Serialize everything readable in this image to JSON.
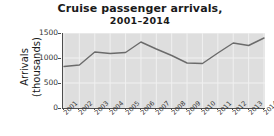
{
  "chart_data": {
    "type": "line",
    "title": "Cruise passenger arrivals,",
    "subtitle": "2001–2014",
    "xlabel": "",
    "ylabel": "Arrivals\n(thousands)",
    "ylabel_line1": "Arrivals",
    "ylabel_line2": "(thousands)",
    "categories": [
      "2001",
      "2002",
      "2003",
      "2004",
      "2005",
      "2006",
      "2007",
      "2008",
      "2009",
      "2010",
      "2011",
      "2012",
      "2013",
      "2014"
    ],
    "values": [
      830,
      860,
      1120,
      1090,
      1110,
      1320,
      1180,
      1050,
      900,
      890,
      1100,
      1300,
      1250,
      1400
    ],
    "series": [
      {
        "name": "Cruise passenger arrivals",
        "values": [
          830,
          860,
          1120,
          1090,
          1110,
          1320,
          1180,
          1050,
          900,
          890,
          1100,
          1300,
          1250,
          1400
        ]
      }
    ],
    "ylim": [
      0,
      1500
    ],
    "yticks": [
      1500,
      1000,
      500,
      0
    ],
    "ytick_labels": [
      "1500",
      "1000",
      "500",
      "0"
    ],
    "grid": true,
    "grid_color": "#f2f2f2",
    "legend": false,
    "legend_position": "none",
    "plot_background": "#dedede",
    "line_color": "#6b6b6b",
    "axis_color": "#4d4d4d",
    "text_color": "#1a1a1a"
  }
}
